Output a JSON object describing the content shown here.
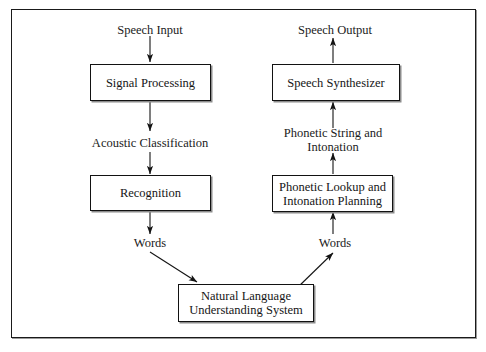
{
  "diagram": {
    "boxes": [
      {
        "id": "signal_processing",
        "label": "Signal Processing"
      },
      {
        "id": "recognition",
        "label": "Recognition"
      },
      {
        "id": "nlu",
        "label": "Natural Language\nUnderstanding System"
      },
      {
        "id": "phonetic_lookup",
        "label": "Phonetic Lookup and\nIntonation Planning"
      },
      {
        "id": "speech_synthesizer",
        "label": "Speech Synthesizer"
      }
    ],
    "labels": [
      {
        "id": "speech_input",
        "text": "Speech Input"
      },
      {
        "id": "acoustic_classification",
        "text": "Acoustic Classification"
      },
      {
        "id": "words_left",
        "text": "Words"
      },
      {
        "id": "speech_output",
        "text": "Speech Output"
      },
      {
        "id": "phonetic_string",
        "text": "Phonetic String and\nIntonation"
      },
      {
        "id": "words_right",
        "text": "Words"
      }
    ],
    "colors": {
      "stroke": "#121212",
      "frame": "#1a1a1a",
      "text": "#151515",
      "background": "#ffffff"
    }
  }
}
